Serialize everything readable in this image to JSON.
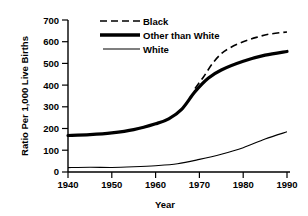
{
  "chart_data": {
    "type": "line",
    "title": "",
    "xlabel": "Year",
    "ylabel": "Ratio Per 1,000 Live Births",
    "xlim": [
      1940,
      1990
    ],
    "ylim": [
      0,
      700
    ],
    "grid": false,
    "legend_position": "top-center",
    "x_ticks": [
      "1940",
      "1950",
      "1960",
      "1970",
      "1980",
      "1990"
    ],
    "y_ticks": [
      "0",
      "100",
      "200",
      "300",
      "400",
      "500",
      "600",
      "700"
    ],
    "series": [
      {
        "name": "Black",
        "style": "dashed",
        "x": [
          1969,
          1971,
          1973,
          1975,
          1977,
          1980,
          1983,
          1986,
          1990
        ],
        "values": [
          385,
          440,
          500,
          545,
          572,
          600,
          620,
          635,
          645
        ]
      },
      {
        "name": "Other than White",
        "style": "thick-solid",
        "x": [
          1940,
          1945,
          1950,
          1955,
          1960,
          1963,
          1966,
          1969,
          1972,
          1975,
          1980,
          1985,
          1990
        ],
        "values": [
          168,
          172,
          180,
          195,
          222,
          245,
          290,
          370,
          432,
          470,
          510,
          538,
          555
        ]
      },
      {
        "name": "White",
        "style": "thin-solid",
        "x": [
          1940,
          1945,
          1950,
          1955,
          1960,
          1965,
          1970,
          1975,
          1980,
          1985,
          1990
        ],
        "values": [
          20,
          22,
          21,
          24,
          29,
          38,
          58,
          82,
          112,
          152,
          185
        ]
      }
    ]
  },
  "legend": {
    "entries": [
      {
        "label": "Black"
      },
      {
        "label": "Other than  White"
      },
      {
        "label": "White"
      }
    ]
  },
  "axes": {
    "x_title": "Year",
    "y_title": "Ratio Per 1,000 Live Births"
  }
}
